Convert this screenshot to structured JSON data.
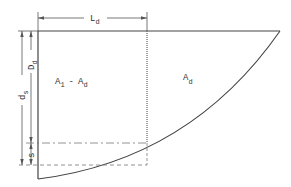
{
  "diagram": {
    "labels": {
      "length": {
        "main": "L",
        "sub": "d"
      },
      "left_region": {
        "a": "A",
        "a_sub": "1",
        "op": "-",
        "b": "A",
        "b_sub": "d"
      },
      "right_region": {
        "main": "A",
        "sub": "d"
      },
      "ds": {
        "main": "d",
        "sub": "s"
      },
      "Dd": {
        "main": "D",
        "sub": "d"
      },
      "s": {
        "main": "s"
      }
    },
    "colors": {
      "stroke": "#444444",
      "text": "#333333",
      "background": "#ffffff"
    }
  }
}
